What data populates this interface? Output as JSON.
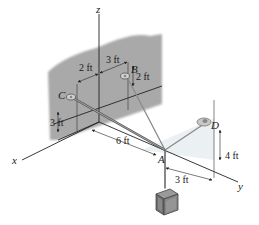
{
  "diagram": {
    "type": "3d-statics-cable-system",
    "axes": {
      "x": "x",
      "y": "y",
      "z": "z"
    },
    "points": {
      "A": "A",
      "B": "B",
      "C": "C",
      "D": "D"
    },
    "dimensions": {
      "c_to_z": "2 ft",
      "z_to_b": "3 ft",
      "b_height": "2 ft",
      "c_height": "3 ft",
      "origin_to_a": "6 ft",
      "a_to_d_horizontal": "3 ft",
      "d_height": "4 ft"
    },
    "colors": {
      "wall": "#a8a8a8",
      "cable": "#555555",
      "axis": "#222222",
      "crate": "#7a7a7a"
    }
  }
}
